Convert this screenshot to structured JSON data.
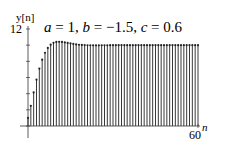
{
  "chart_data": {
    "type": "stem",
    "title_parts": {
      "a": "1",
      "b": "-1.5",
      "c": "0.6"
    },
    "xlabel": "n",
    "ylabel": "y[n]",
    "xlim": [
      0,
      60
    ],
    "ylim": [
      0,
      12
    ],
    "x_ticks_labeled": [
      60
    ],
    "y_ticks_labeled": [
      12
    ],
    "y_tick_step": 2,
    "grid": false,
    "legend": null,
    "x": [
      0,
      1,
      2,
      3,
      4,
      5,
      6,
      7,
      8,
      9,
      10,
      11,
      12,
      13,
      14,
      15,
      16,
      17,
      18,
      19,
      20,
      21,
      22,
      23,
      24,
      25,
      26,
      27,
      28,
      29,
      30,
      31,
      32,
      33,
      34,
      35,
      36,
      37,
      38,
      39,
      40,
      41,
      42,
      43,
      44,
      45,
      46,
      47,
      48,
      49,
      50,
      51,
      52,
      53,
      54,
      55,
      56,
      57,
      58,
      59,
      60
    ],
    "values": [
      1.0,
      2.5,
      4.15,
      5.73,
      7.1,
      8.21,
      9.06,
      9.66,
      10.06,
      10.29,
      10.4,
      10.42,
      10.4,
      10.34,
      10.28,
      10.21,
      10.15,
      10.09,
      10.05,
      10.03,
      10.01,
      9.99,
      9.99,
      9.98,
      9.98,
      9.98,
      9.99,
      9.99,
      9.99,
      10.0,
      10.0,
      10.0,
      10.0,
      10.0,
      10.0,
      10.0,
      10.0,
      10.0,
      10.0,
      10.0,
      10.0,
      10.0,
      10.0,
      10.0,
      10.0,
      10.0,
      10.0,
      10.0,
      10.0,
      10.0,
      10.0,
      10.0,
      10.0,
      10.0,
      10.0,
      10.0,
      10.0,
      10.0,
      10.0,
      10.0,
      10.0
    ]
  },
  "labels": {
    "title_prefix_a": "a",
    "title_eq": " = 1, ",
    "title_b": "b",
    "title_eq_b": " = −1.5, ",
    "title_c": "c",
    "title_eq_c": " = 0.6",
    "ylabel": "y[n]",
    "ytick_top": "12",
    "xtick_end": "60",
    "xlabel": "n"
  },
  "colors": {
    "stem": "#222222",
    "axis": "#333333"
  }
}
